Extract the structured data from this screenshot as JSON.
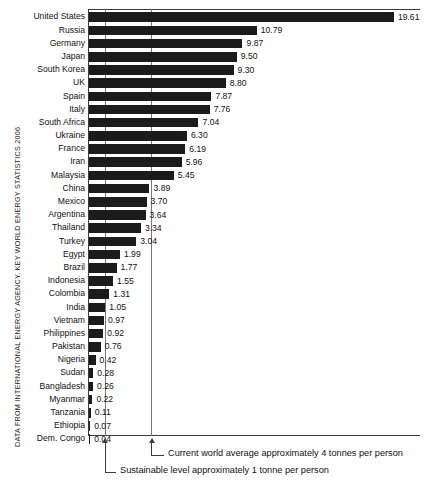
{
  "chart_data": {
    "type": "bar",
    "orientation": "horizontal",
    "title": "",
    "subtitle": "",
    "xlabel": "",
    "ylabel": "",
    "unit": "tonnes per person",
    "xlim": [
      0,
      21.35
    ],
    "grid": false,
    "legend": null,
    "categories": [
      "United States",
      "Russia",
      "Germany",
      "Japan",
      "South Korea",
      "UK",
      "Spain",
      "Italy",
      "South Africa",
      "Ukraine",
      "France",
      "Iran",
      "Malaysia",
      "China",
      "Mexico",
      "Argentina",
      "Thailand",
      "Turkey",
      "Egypt",
      "Brazil",
      "Indonesia",
      "Colombia",
      "India",
      "Vietnam",
      "Philippines",
      "Pakistan",
      "Nigeria",
      "Sudan",
      "Bangladesh",
      "Myanmar",
      "Tanzania",
      "Ethiopia",
      "Dem. Congo"
    ],
    "values": [
      19.61,
      10.79,
      9.87,
      9.5,
      9.3,
      8.8,
      7.87,
      7.76,
      7.04,
      6.3,
      6.19,
      5.96,
      5.45,
      3.89,
      3.7,
      3.64,
      3.34,
      3.04,
      1.99,
      1.77,
      1.55,
      1.31,
      1.05,
      0.97,
      0.92,
      0.76,
      0.42,
      0.28,
      0.26,
      0.22,
      0.11,
      0.07,
      0.04
    ],
    "value_labels": [
      "19.61",
      "10.79",
      "9.87",
      "9.50",
      "9.30",
      "8.80",
      "7.87",
      "7.76",
      "7.04",
      "6.30",
      "6.19",
      "5.96",
      "5.45",
      "3.89",
      "3.70",
      "3.64",
      "3.34",
      "3.04",
      "1.99",
      "1.77",
      "1.55",
      "1.31",
      "1.05",
      "0.97",
      "0.92",
      "0.76",
      "0.42",
      "0.28",
      "0.26",
      "0.22",
      "0.11",
      "0.07",
      "0.04"
    ],
    "reference_lines": [
      {
        "name": "sustainable-level",
        "value": 1,
        "label": "Sustainable level approximately 1 tonne per person"
      },
      {
        "name": "current-world-average",
        "value": 4,
        "label": "Current world average approximately 4 tonnes per person"
      }
    ],
    "colors": {
      "bar": "#1b1b1b",
      "axis": "#3a3a3a",
      "reference_line": "#777777",
      "text": "#111111",
      "background": "#ffffff"
    }
  },
  "annotations": {
    "world_average": "Current world average approximately 4 tonnes per person",
    "sustainable": "Sustainable level approximately 1 tonne per person"
  },
  "source": {
    "caption": "Data from International Energy Agency, Key World Energy Statistics 2006"
  }
}
